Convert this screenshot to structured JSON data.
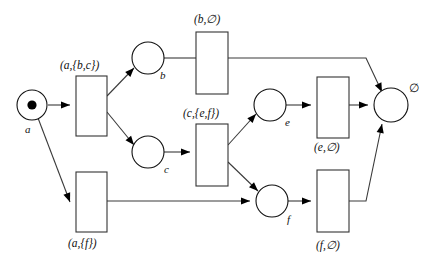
{
  "diagram": {
    "places": [
      {
        "id": "p-a",
        "label": "a",
        "cx": 32,
        "cy": 105,
        "r": 15,
        "token": true,
        "label_x": 25,
        "label_y": 124
      },
      {
        "id": "p-b",
        "label": "b",
        "cx": 148,
        "cy": 58,
        "r": 16,
        "token": false,
        "label_x": 160,
        "label_y": 70
      },
      {
        "id": "p-c",
        "label": "c",
        "cx": 148,
        "cy": 152,
        "r": 16,
        "token": false,
        "label_x": 164,
        "label_y": 164
      },
      {
        "id": "p-e",
        "label": "e",
        "cx": 270,
        "cy": 105,
        "r": 16,
        "token": false,
        "label_x": 285,
        "label_y": 117
      },
      {
        "id": "p-f",
        "label": "f",
        "cx": 272,
        "cy": 201,
        "r": 16,
        "token": false,
        "label_x": 287,
        "label_y": 214
      },
      {
        "id": "p-final",
        "label": "∅",
        "cx": 391,
        "cy": 105,
        "r": 17,
        "token": false,
        "label_x": 409,
        "label_y": 83
      }
    ],
    "transitions": [
      {
        "id": "t-abc",
        "label": "(a,{b,c})",
        "x": 76,
        "y": 76,
        "w": 31,
        "h": 60,
        "label_x": 60,
        "label_y": 60,
        "label_pos": "above"
      },
      {
        "id": "t-af",
        "label": "(a,{f})",
        "x": 76,
        "y": 172,
        "w": 31,
        "h": 60,
        "label_x": 68,
        "label_y": 238,
        "label_pos": "below"
      },
      {
        "id": "t-b",
        "label": "(b,∅)",
        "x": 196,
        "y": 32,
        "w": 32,
        "h": 62,
        "label_x": 194,
        "label_y": 14,
        "label_pos": "above"
      },
      {
        "id": "t-cef",
        "label": "(c,{e,f})",
        "x": 196,
        "y": 124,
        "w": 32,
        "h": 62,
        "label_x": 183,
        "label_y": 108,
        "label_pos": "above"
      },
      {
        "id": "t-e",
        "label": "(e,∅)",
        "x": 317,
        "y": 77,
        "w": 32,
        "h": 61,
        "label_x": 314,
        "label_y": 142,
        "label_pos": "below"
      },
      {
        "id": "t-f",
        "label": "(f,∅)",
        "x": 317,
        "y": 170,
        "w": 32,
        "h": 62,
        "label_x": 316,
        "label_y": 240,
        "label_pos": "below"
      }
    ],
    "arcs": [
      {
        "id": "arc-a-to-abc",
        "from": "p-a",
        "to": "t-abc",
        "path": "M 48,105 L 70,105",
        "head": "right"
      },
      {
        "id": "arc-a-to-af",
        "from": "p-a",
        "to": "t-af",
        "path": "M 38,118 L 70,202",
        "head": "right"
      },
      {
        "id": "arc-abc-to-b",
        "from": "t-abc",
        "to": "p-b",
        "path": "M 107,96 L 134,68",
        "head": "upright"
      },
      {
        "id": "arc-abc-to-c",
        "from": "t-abc",
        "to": "p-c",
        "path": "M 107,112 L 134,145",
        "head": "downright"
      },
      {
        "id": "arc-b-to-tb",
        "from": "p-b",
        "to": "t-b",
        "path": "M 164,58 L 196,58",
        "head": "none"
      },
      {
        "id": "arc-tb-to-final",
        "from": "t-b",
        "to": "p-final",
        "path": "M 228,58 L 366,58 L 382,92",
        "head": "downright"
      },
      {
        "id": "arc-c-to-tcef",
        "from": "p-c",
        "to": "t-cef",
        "path": "M 164,152 L 190,152",
        "head": "right"
      },
      {
        "id": "arc-tcef-to-e",
        "from": "t-cef",
        "to": "p-e",
        "path": "M 228,145 L 256,114",
        "head": "upright"
      },
      {
        "id": "arc-tcef-to-f",
        "from": "t-cef",
        "to": "p-f",
        "path": "M 228,162 L 258,191",
        "head": "downright"
      },
      {
        "id": "arc-af-to-f",
        "from": "t-af",
        "to": "p-f",
        "path": "M 107,201 L 250,201",
        "head": "right"
      },
      {
        "id": "arc-e-to-te",
        "from": "p-e",
        "to": "t-e",
        "path": "M 286,105 L 311,105",
        "head": "right"
      },
      {
        "id": "arc-te-to-final",
        "from": "t-e",
        "to": "p-final",
        "path": "M 349,105 L 368,105",
        "head": "right"
      },
      {
        "id": "arc-f-to-tf",
        "from": "p-f",
        "to": "t-f",
        "path": "M 288,201 L 311,201",
        "head": "right"
      },
      {
        "id": "arc-tf-to-final",
        "from": "t-f",
        "to": "p-final",
        "path": "M 349,201 L 366,201 L 382,124",
        "head": "upright"
      }
    ]
  }
}
